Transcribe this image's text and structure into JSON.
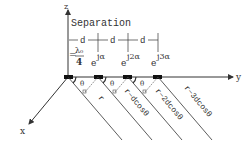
{
  "title": "Separation",
  "axes": {
    "z": "z",
    "y": "y",
    "x": "x"
  },
  "spacing": {
    "label": "d",
    "value_lambda": "λ₀",
    "value_den": "4",
    "eq": "="
  },
  "phases": [
    "e",
    "jα",
    "e",
    "j2α",
    "e",
    "j3α"
  ],
  "angles": [
    "θ",
    "θ",
    "θ",
    "θ"
  ],
  "distances": [
    "r",
    "r−dcosθ",
    "r−2dcosθ",
    "r−3dcosθ"
  ],
  "colors": {
    "line": "#333333",
    "element": "#111111"
  }
}
